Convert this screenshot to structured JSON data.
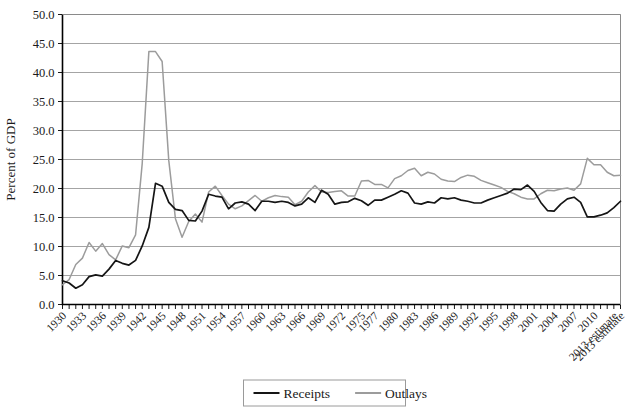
{
  "chart_data": {
    "type": "line",
    "title": "",
    "subtitle": "",
    "xlabel": "",
    "ylabel": "Percent of GDP",
    "ylim": [
      0.0,
      50.0
    ],
    "ytick_step": 5.0,
    "ytick_labels": [
      "0.0",
      "5.0",
      "10.0",
      "15.0",
      "20.0",
      "25.0",
      "30.0",
      "35.0",
      "40.0",
      "45.0",
      "50.0"
    ],
    "grid": "horizontal",
    "legend_position": "bottom-center",
    "x": [
      "1930",
      "1931",
      "1932",
      "1933",
      "1934",
      "1935",
      "1936",
      "1937",
      "1938",
      "1939",
      "1940",
      "1941",
      "1942",
      "1943",
      "1944",
      "1945",
      "1946",
      "1947",
      "1948",
      "1949",
      "1950",
      "1951",
      "1952",
      "1953",
      "1954",
      "1955",
      "1956",
      "1957",
      "1958",
      "1959",
      "1960",
      "1961",
      "1962",
      "1963",
      "1964",
      "1965",
      "1966",
      "1967",
      "1968",
      "1969",
      "1970",
      "1971",
      "1972",
      "1973",
      "1974",
      "1975",
      "1976",
      "1977",
      "1978",
      "1979",
      "1980",
      "1981",
      "1982",
      "1983",
      "1984",
      "1985",
      "1986",
      "1987",
      "1988",
      "1989",
      "1990",
      "1991",
      "1992",
      "1993",
      "1994",
      "1995",
      "1996",
      "1997",
      "1998",
      "1999",
      "2000",
      "2001",
      "2002",
      "2003",
      "2004",
      "2005",
      "2006",
      "2007",
      "2008",
      "2009",
      "2010",
      "2011",
      "2012",
      "2013 estimate",
      "2013 estimate"
    ],
    "xtick_labels_shown": [
      "1930",
      "1933",
      "1936",
      "1939",
      "1942",
      "1945",
      "1948",
      "1951",
      "1954",
      "1957",
      "1960",
      "1963",
      "1966",
      "1969",
      "1972",
      "1975",
      "1977",
      "1980",
      "1983",
      "1986",
      "1989",
      "1992",
      "1995",
      "1998",
      "2001",
      "2004",
      "2007",
      "2010",
      "2013 estimate",
      "2013 estimate"
    ],
    "series": [
      {
        "name": "Receipts",
        "color": "#151515",
        "values": [
          4.1,
          3.7,
          2.8,
          3.4,
          4.8,
          5.1,
          4.9,
          6.1,
          7.6,
          7.1,
          6.8,
          7.6,
          10.1,
          13.3,
          20.9,
          20.4,
          17.6,
          16.4,
          16.2,
          14.5,
          14.4,
          16.1,
          19.0,
          18.7,
          18.5,
          16.5,
          17.5,
          17.7,
          17.3,
          16.2,
          17.8,
          17.8,
          17.6,
          17.8,
          17.6,
          17.0,
          17.3,
          18.4,
          17.6,
          19.7,
          19.0,
          17.3,
          17.6,
          17.7,
          18.3,
          17.9,
          17.1,
          18.0,
          18.0,
          18.5,
          19.0,
          19.6,
          19.2,
          17.5,
          17.3,
          17.7,
          17.5,
          18.4,
          18.2,
          18.4,
          18.0,
          17.8,
          17.5,
          17.5,
          18.0,
          18.4,
          18.8,
          19.2,
          19.9,
          19.8,
          20.6,
          19.5,
          17.6,
          16.2,
          16.1,
          17.3,
          18.2,
          18.5,
          17.6,
          15.1,
          15.1,
          15.4,
          15.8,
          16.7,
          17.8
        ]
      },
      {
        "name": "Outlays",
        "color": "#9c9c9c",
        "values": [
          3.4,
          4.3,
          6.9,
          8.0,
          10.7,
          9.2,
          10.5,
          8.6,
          7.7,
          10.1,
          9.8,
          12.0,
          24.3,
          43.6,
          43.6,
          41.9,
          24.8,
          14.8,
          11.6,
          14.3,
          15.6,
          14.2,
          19.4,
          20.4,
          18.8,
          17.3,
          16.5,
          17.0,
          17.9,
          18.8,
          17.8,
          18.4,
          18.8,
          18.6,
          18.5,
          17.2,
          17.8,
          19.4,
          20.5,
          19.4,
          19.3,
          19.5,
          19.6,
          18.7,
          18.7,
          21.3,
          21.4,
          20.7,
          20.7,
          20.1,
          21.7,
          22.2,
          23.1,
          23.5,
          22.2,
          22.8,
          22.5,
          21.6,
          21.3,
          21.2,
          21.9,
          22.3,
          22.1,
          21.4,
          21.0,
          20.6,
          20.2,
          19.5,
          19.1,
          18.5,
          18.2,
          18.2,
          19.1,
          19.7,
          19.6,
          19.9,
          20.1,
          19.7,
          20.8,
          25.2,
          24.1,
          24.1,
          22.8,
          22.2,
          22.3
        ]
      }
    ],
    "legend": [
      {
        "label": "Receipts",
        "color": "#151515"
      },
      {
        "label": "Outlays",
        "color": "#9c9c9c"
      }
    ]
  }
}
